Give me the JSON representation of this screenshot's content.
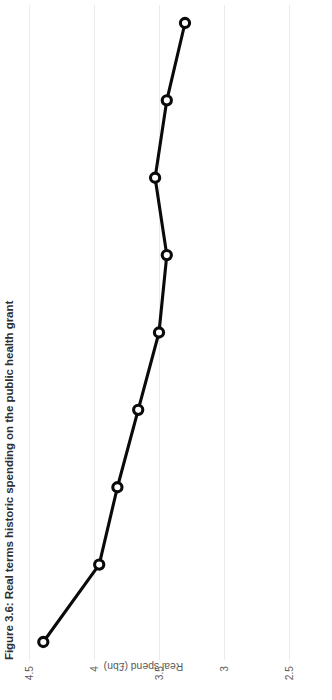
{
  "figure": {
    "title_prefix": "Figure 3.6:",
    "title_rest": " Real terms historic spending on the public health grant",
    "title_full": "Figure 3.6: Real terms historic spending on the public health grant",
    "orientation_note": "rotated-90-ccw",
    "background_color": "#ffffff",
    "line_color": "#0a0a0a",
    "gridline_color": "#ebebeb",
    "tick_label_color": "#5d5d5d"
  },
  "chart_data": {
    "type": "line",
    "title": "Figure 3.6: Real terms historic spending on the public health grant",
    "xlabel": "",
    "ylabel": "Real spend (£bn)",
    "ylim": [
      2.5,
      4.5
    ],
    "yticks": [
      4.5,
      4,
      3.5,
      3,
      2.5
    ],
    "ytick_labels": [
      "4.5",
      "4",
      "3.5",
      "3",
      "2.5"
    ],
    "grid": true,
    "legend": "none",
    "x": [
      1,
      2,
      3,
      4,
      5,
      6,
      7,
      8,
      9
    ],
    "xtick_labels": [],
    "series": [
      {
        "name": "Real spend (£bn)",
        "values": [
          4.39,
          3.96,
          3.82,
          3.66,
          3.5,
          3.44,
          3.53,
          3.44,
          3.3
        ],
        "marker": "open-circle",
        "color": "#0a0a0a"
      }
    ]
  }
}
